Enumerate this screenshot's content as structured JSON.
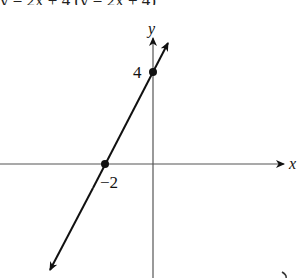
{
  "header": {
    "clipped_text": "y = 2x + 4 (y = 2x + 4)"
  },
  "graph": {
    "x_axis_label": "x",
    "y_axis_label": "y",
    "points": [
      {
        "label": "4",
        "x": 0,
        "y": 4,
        "description": "y-intercept"
      },
      {
        "label": "−2",
        "x": -2,
        "y": 0,
        "description": "x-intercept"
      }
    ],
    "line": {
      "slope": 2,
      "intercept": 4
    },
    "colors": {
      "axis": "#555555",
      "line": "#111111",
      "point": "#111111"
    }
  }
}
